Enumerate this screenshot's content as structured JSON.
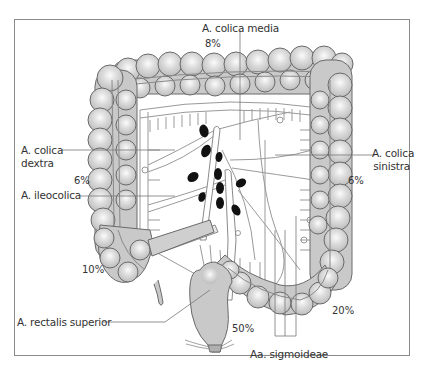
{
  "figure": {
    "colors": {
      "colon_fill": "#c9c9c9",
      "colon_highlight": "#f4f4f4",
      "outline": "#6a6a6a",
      "vessel": "#ffffff",
      "vessel_outline": "#8a8a8a",
      "lymph_node": "#111111",
      "frame": "#8a8a8a",
      "text": "#333333"
    }
  },
  "labels": {
    "colica_media": "A. colica media",
    "colica_dextra_1": "A. colica",
    "colica_dextra_2": "dextra",
    "ileocolica": "A. ileocolica",
    "colica_sinistra_1": "A. colica",
    "colica_sinistra_2": "sinistra",
    "rectalis_superior": "A. rectalis superior",
    "sigmoideae": "Aa. sigmoideae"
  },
  "percentages": {
    "colica_media": "8%",
    "right_colon": "6%",
    "left_colon": "6%",
    "cecum": "10%",
    "sigmoid": "20%",
    "rectum": "50%"
  }
}
